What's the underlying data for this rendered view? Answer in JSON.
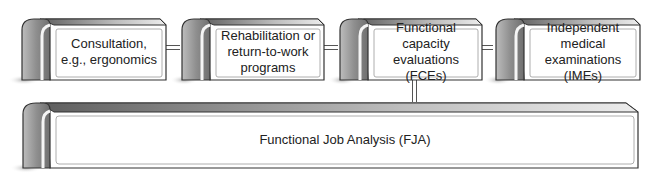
{
  "diagram": {
    "type": "hierarchy",
    "top_row": [
      {
        "id": "consultation",
        "label": "Consultation, e.g., ergonomics",
        "lines": [
          "Consultation,",
          "e.g., ergonomics"
        ]
      },
      {
        "id": "rehabilitation",
        "label": "Rehabilitation or return-to-work programs",
        "lines": [
          "Rehabilitation or",
          "return-to-work",
          "programs"
        ]
      },
      {
        "id": "fce",
        "label": "Functional capacity evaluations (FCEs)",
        "lines": [
          "Functional capacity",
          "evaluations (FCEs)"
        ]
      },
      {
        "id": "ime",
        "label": "Independent medical examinations (IMEs)",
        "lines": [
          "Independent medical",
          "examinations (IMEs)"
        ]
      }
    ],
    "base": {
      "id": "fja",
      "label": "Functional Job Analysis (FJA)"
    },
    "connections": [
      [
        "consultation",
        "rehabilitation"
      ],
      [
        "rehabilitation",
        "fce"
      ],
      [
        "fce",
        "ime"
      ],
      [
        "fce",
        "fja"
      ]
    ],
    "colors": {
      "outline": "#333333",
      "face": "#ffffff",
      "top_dark": "#6e6e6e",
      "top_light": "#e6e6e6",
      "end_cap_dark": "#8a8a8a",
      "end_cap_light": "#d8d8d8",
      "shadow": "#bdbdbd",
      "text": "#222222"
    }
  }
}
